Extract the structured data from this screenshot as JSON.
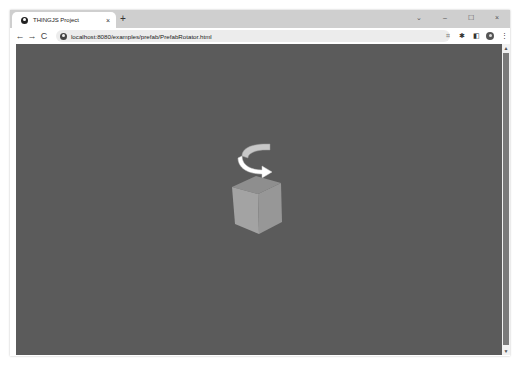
{
  "browser": {
    "tab": {
      "title": "THINGJS Project",
      "favicon": "globe-icon",
      "close_glyph": "×"
    },
    "new_tab_glyph": "+",
    "window_controls": {
      "dropdown": "⌄",
      "minimize": "–",
      "maximize": "☐",
      "close": "×"
    },
    "nav": {
      "back": "←",
      "forward": "→",
      "reload": "C"
    },
    "address_bar": {
      "url": "localhost:8080/examples/prefab/PrefabRotator.html",
      "site_icon": "info-icon"
    },
    "toolbar_icons": {
      "screenshot": "⌗",
      "extensions": "✱",
      "side_panel": "◧",
      "profile": "avatar",
      "menu": "⋮"
    }
  },
  "scene": {
    "background_color": "#5b5b5b",
    "cube": {
      "top_color": "#8e8e8e",
      "left_color": "#a3a3a3",
      "right_color": "#979797"
    },
    "rotation_arrow": {
      "front_color": "#ffffff",
      "back_color": "#c8c8c8"
    }
  },
  "scrollbar": {
    "up_glyph": "▲",
    "down_glyph": "▼"
  }
}
